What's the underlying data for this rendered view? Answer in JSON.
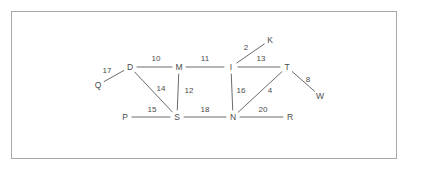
{
  "figure": {
    "type": "weighted-undirected-graph",
    "background_color": "#ffffff",
    "frame_color": "#a8a8a8",
    "line_color": "#6b6b6b",
    "text_color": "#4a4a4a"
  },
  "graph": {
    "nodes": [
      {
        "id": "Q",
        "label": "Q",
        "x": 98,
        "y": 85
      },
      {
        "id": "D",
        "label": "D",
        "x": 130,
        "y": 67
      },
      {
        "id": "M",
        "label": "M",
        "x": 179,
        "y": 67
      },
      {
        "id": "I",
        "label": "I",
        "x": 231,
        "y": 67
      },
      {
        "id": "T",
        "label": "T",
        "x": 287,
        "y": 67
      },
      {
        "id": "K",
        "label": "K",
        "x": 270,
        "y": 40
      },
      {
        "id": "W",
        "label": "W",
        "x": 320,
        "y": 96
      },
      {
        "id": "P",
        "label": "P",
        "x": 125,
        "y": 117
      },
      {
        "id": "S",
        "label": "S",
        "x": 177,
        "y": 117
      },
      {
        "id": "N",
        "label": "N",
        "x": 233,
        "y": 117
      },
      {
        "id": "R",
        "label": "R",
        "x": 290,
        "y": 117
      }
    ],
    "edges": [
      {
        "from": "Q",
        "to": "D",
        "weight": "17",
        "label_x": 107,
        "label_y": 71
      },
      {
        "from": "D",
        "to": "M",
        "weight": "10",
        "label_x": 156,
        "label_y": 59
      },
      {
        "from": "M",
        "to": "I",
        "weight": "11",
        "label_x": 205,
        "label_y": 59
      },
      {
        "from": "I",
        "to": "K",
        "weight": "2",
        "label_x": 246,
        "label_y": 48
      },
      {
        "from": "I",
        "to": "T",
        "weight": "13",
        "label_x": 261,
        "label_y": 59
      },
      {
        "from": "T",
        "to": "W",
        "weight": "8",
        "label_x": 308,
        "label_y": 80
      },
      {
        "from": "D",
        "to": "S",
        "weight": "14",
        "label_x": 161,
        "label_y": 89
      },
      {
        "from": "M",
        "to": "S",
        "weight": "12",
        "label_x": 189,
        "label_y": 91
      },
      {
        "from": "I",
        "to": "N",
        "weight": "16",
        "label_x": 241,
        "label_y": 91
      },
      {
        "from": "N",
        "to": "T",
        "weight": "4",
        "label_x": 270,
        "label_y": 91
      },
      {
        "from": "P",
        "to": "S",
        "weight": "15",
        "label_x": 152,
        "label_y": 110
      },
      {
        "from": "S",
        "to": "N",
        "weight": "18",
        "label_x": 205,
        "label_y": 110
      },
      {
        "from": "N",
        "to": "R",
        "weight": "20",
        "label_x": 263,
        "label_y": 110
      }
    ]
  }
}
